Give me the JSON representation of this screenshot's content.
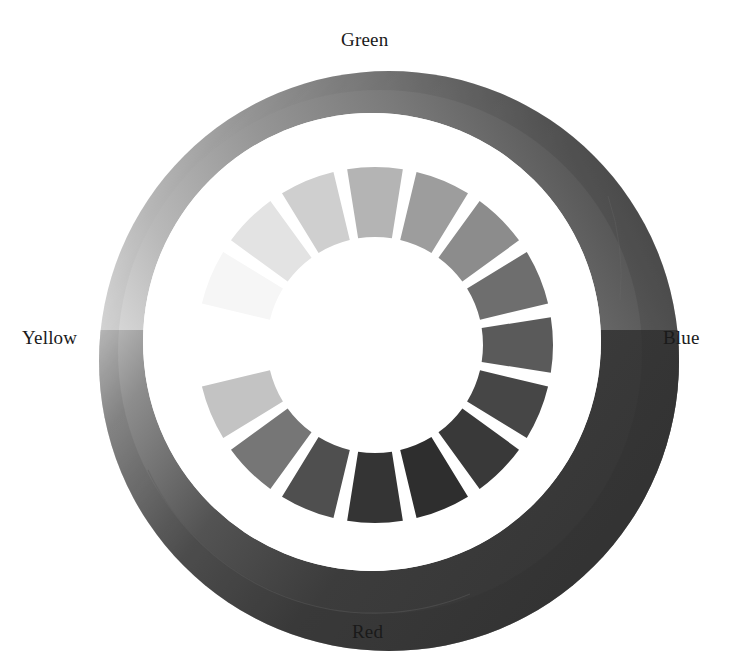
{
  "figure": {
    "background": "#ffffff"
  },
  "labels": {
    "green": "Green",
    "blue": "Blue",
    "red": "Red",
    "yellow": "Yellow"
  },
  "chart_data": {
    "type": "pie",
    "title": "",
    "subtitle": "",
    "xlabel": "",
    "ylabel": "",
    "legend_position": "around-perimeter",
    "grid": false,
    "axis_labels": [
      "Green",
      "Blue",
      "Red",
      "Yellow"
    ],
    "axis_label_angles_deg": [
      90,
      0,
      270,
      180
    ],
    "center": {
      "x": 375,
      "y": 345
    },
    "inner_ring": {
      "description": "16 equal wedge segments, 22.5 degrees each, grayscale ramp",
      "segment_count": 16,
      "segment_angle_deg": 22.5,
      "gap_deg": 4.5,
      "inner_radius": 108,
      "outer_radius": 178,
      "categories": [
        "s1",
        "s2",
        "s3",
        "s4",
        "s5",
        "s6",
        "s7",
        "s8",
        "s9",
        "s10",
        "s11",
        "s12",
        "s13",
        "s14",
        "s15",
        "s16"
      ],
      "angles_deg": [
        180,
        157.5,
        135,
        112.5,
        90,
        67.5,
        45,
        22.5,
        0,
        337.5,
        315,
        292.5,
        270,
        247.5,
        225,
        202.5
      ],
      "values": [
        100,
        96,
        88,
        78,
        66,
        55,
        44,
        33,
        25,
        18,
        14,
        16,
        21,
        35,
        52,
        74
      ],
      "colors": [
        "#ffffff",
        "#f6f6f6",
        "#e3e3e3",
        "#cfcfcf",
        "#b4b4b4",
        "#9d9d9d",
        "#8c8c8c",
        "#6e6e6e",
        "#5a5a5a",
        "#464646",
        "#393939",
        "#2e2e2e",
        "#343434",
        "#4f4f4f",
        "#767676",
        "#c3c3c3"
      ]
    },
    "outer_ring": {
      "description": "Tilted 3D annulus (torus) with grayscale gradient, light at Yellow, mid at Green, dark at Blue and Red",
      "outer_radius": 290,
      "inner_radius": 228,
      "tilt_offset": {
        "dx": 14,
        "dy": 16
      },
      "gradient_stops": [
        {
          "angle_deg": 180,
          "color": "#ffffff"
        },
        {
          "angle_deg": 135,
          "color": "#b9b9b9"
        },
        {
          "angle_deg": 90,
          "color": "#8f8f8f"
        },
        {
          "angle_deg": 45,
          "color": "#6a6a6a"
        },
        {
          "angle_deg": 0,
          "color": "#3c3c3c"
        },
        {
          "angle_deg": 315,
          "color": "#383838"
        },
        {
          "angle_deg": 270,
          "color": "#3a3a3a"
        },
        {
          "angle_deg": 225,
          "color": "#6f6f6f"
        }
      ],
      "shadow_color": "#2b2b2b",
      "highlight_color": "#ffffff"
    }
  }
}
